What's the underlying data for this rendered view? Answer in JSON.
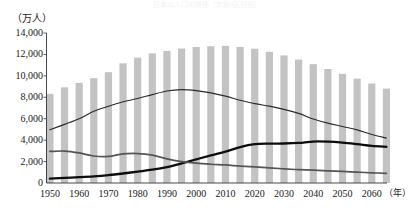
{
  "chart": {
    "title": "日本の人口の推移（年齢3区分別）",
    "y_axis_unit": "（万人）",
    "x_axis_unit": "（年）"
  },
  "chart_data": {
    "type": "bar",
    "title": "日本の人口の推移（年齢3区分別）",
    "xlabel": "（年）",
    "ylabel": "（万人）",
    "ylim": [
      0,
      14000
    ],
    "ytick_values": [
      0,
      2000,
      4000,
      6000,
      8000,
      10000,
      12000,
      14000
    ],
    "ytick_labels": [
      "0",
      "2,000",
      "4,000",
      "6,000",
      "8,000",
      "10,000",
      "12,000",
      "14,000"
    ],
    "xlim": [
      1950,
      2065
    ],
    "xtick_values": [
      1950,
      1960,
      1970,
      1980,
      1990,
      2000,
      2010,
      2020,
      2030,
      2040,
      2050,
      2060
    ],
    "xtick_labels": [
      "1950",
      "1960",
      "1970",
      "1980",
      "1990",
      "2000",
      "2010",
      "2020",
      "2030",
      "2040",
      "2050",
      "2060"
    ],
    "grid": false,
    "legend": "none",
    "x": [
      1950,
      1955,
      1960,
      1965,
      1970,
      1975,
      1980,
      1985,
      1990,
      1995,
      2000,
      2005,
      2010,
      2015,
      2020,
      2025,
      2030,
      2035,
      2040,
      2045,
      2050,
      2055,
      2060,
      2065
    ],
    "categories": [
      "1950",
      "1955",
      "1960",
      "1965",
      "1970",
      "1975",
      "1980",
      "1985",
      "1990",
      "1995",
      "2000",
      "2005",
      "2010",
      "2015",
      "2020",
      "2025",
      "2030",
      "2035",
      "2040",
      "2045",
      "2050",
      "2055",
      "2060",
      "2065"
    ],
    "bar_series": {
      "name": "総人口",
      "color": "#c3c3c3",
      "values": [
        8320,
        8930,
        9340,
        9790,
        10340,
        11170,
        11700,
        12100,
        12330,
        12550,
        12690,
        12770,
        12800,
        12700,
        12530,
        12250,
        11910,
        11520,
        11090,
        10640,
        10190,
        9740,
        9280,
        8810
      ]
    },
    "series": [
      {
        "name": "15〜64歳（生産年齢人口）",
        "style": "thin-line",
        "color": "#2b2b2b",
        "values": [
          4966,
          5473,
          6000,
          6693,
          7157,
          7581,
          7884,
          8251,
          8590,
          8716,
          8622,
          8409,
          8103,
          7728,
          7406,
          7170,
          6875,
          6494,
          5978,
          5584,
          5275,
          4955,
          4529,
          4189
        ]
      },
      {
        "name": "65歳以上（老年人口）",
        "style": "thick-line",
        "color": "#0d0d0d",
        "values": [
          411,
          475,
          540,
          618,
          733,
          887,
          1065,
          1247,
          1489,
          1826,
          2204,
          2576,
          2925,
          3347,
          3619,
          3677,
          3685,
          3741,
          3868,
          3856,
          3768,
          3626,
          3464,
          3381
        ]
      },
      {
        "name": "0〜14歳（年少人口）",
        "style": "medium-gray-line",
        "color": "#555555",
        "values": [
          2943,
          2980,
          2807,
          2517,
          2482,
          2722,
          2751,
          2603,
          2249,
          2001,
          1847,
          1752,
          1684,
          1583,
          1503,
          1407,
          1321,
          1246,
          1194,
          1138,
          1077,
          1012,
          951,
          898
        ]
      }
    ]
  }
}
